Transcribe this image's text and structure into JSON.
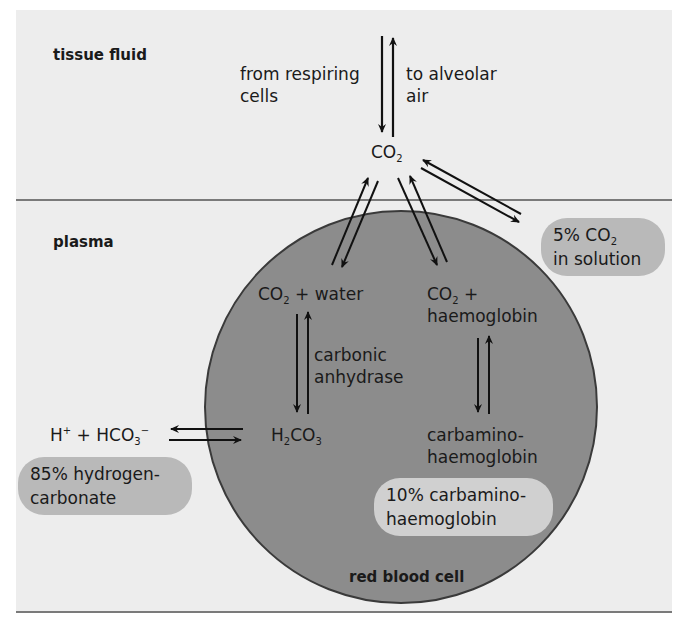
{
  "regions": {
    "tissue_fluid": "tissue fluid",
    "plasma": "plasma",
    "red_blood_cell": "red blood cell"
  },
  "labels": {
    "from_respiring_1": "from respiring",
    "from_respiring_2": "cells",
    "to_alveolar_1": "to alveolar",
    "to_alveolar_2": "air",
    "co2_top": "CO",
    "co2_top_sub": "2",
    "co2_water_a": "CO",
    "co2_water_sub": "2",
    "co2_water_b": " + water",
    "co2_hb_a": "CO",
    "co2_hb_sub": "2",
    "co2_hb_b": " +",
    "co2_hb_line2": "haemoglobin",
    "carbonic_1": "carbonic",
    "carbonic_2": "anhydrase",
    "h2co3_a": "H",
    "h2co3_sub1": "2",
    "h2co3_b": "CO",
    "h2co3_sub2": "3",
    "hplus_a": "H",
    "hplus_sup": "+",
    "hplus_b": " + HCO",
    "hco3_sub": "3",
    "hco3_sup": "−",
    "carbamino_1": "carbamino-",
    "carbamino_2": "haemoglobin"
  },
  "pills": {
    "solution_a": "5% CO",
    "solution_sub": "2",
    "solution_line2": "in solution",
    "hydrogen_1": "85% hydrogen-",
    "hydrogen_2": "carbonate",
    "carbamino_1": "10% carbamino-",
    "carbamino_2": "haemoglobin"
  },
  "colors": {
    "panel": "#ededed",
    "divider": "#7a7a7a",
    "cell_fill": "#8c8c8c",
    "cell_stroke": "#3a3a3a",
    "pill": "#b9b9b9",
    "pill_light": "#d0d0d0"
  }
}
